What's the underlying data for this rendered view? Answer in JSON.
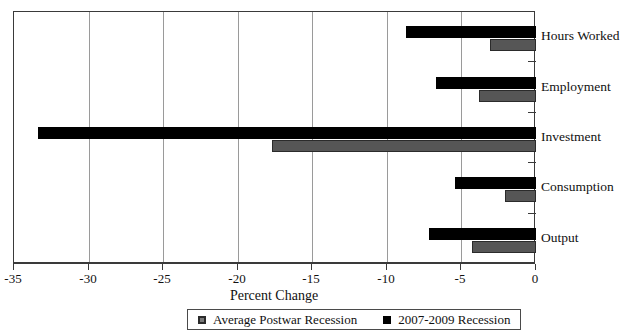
{
  "chart_data": {
    "type": "bar",
    "orientation": "horizontal",
    "title": "",
    "xlabel": "Percent Change",
    "ylabel": "",
    "xlim": [
      -35,
      0
    ],
    "xticks": [
      -35,
      -30,
      -25,
      -20,
      -15,
      -10,
      -5,
      0
    ],
    "xtick_labels": [
      "-35",
      "-30",
      "-25",
      "-20",
      "-15",
      "-10",
      "-5",
      "0"
    ],
    "grid": "vertical",
    "legend_position": "bottom-center",
    "categories": [
      "Hours Worked",
      "Employment",
      "Investment",
      "Consumption",
      "Output"
    ],
    "series": [
      {
        "name": "Average Postwar Recession",
        "color": "#565656",
        "values": [
          -3.1,
          -3.8,
          -17.7,
          -2.1,
          -4.3
        ]
      },
      {
        "name": "2007-2009 Recession",
        "color": "#000000",
        "values": [
          -8.7,
          -6.7,
          -33.4,
          -5.4,
          -7.2
        ]
      }
    ]
  },
  "axis": {
    "x_title": "Percent Change"
  },
  "legend": {
    "entries": [
      {
        "label": "Average Postwar Recession",
        "swatch": "gray"
      },
      {
        "label": "2007-2009 Recession",
        "swatch": "dark"
      }
    ]
  }
}
